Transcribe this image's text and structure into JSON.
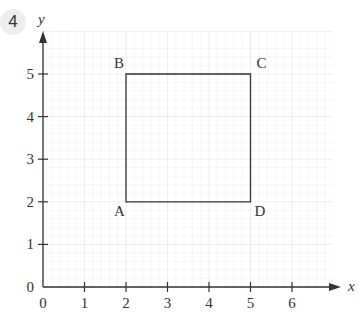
{
  "question_number": "4",
  "axes": {
    "x_label": "x",
    "y_label": "y",
    "x_ticks": [
      "0",
      "1",
      "2",
      "3",
      "4",
      "5",
      "6"
    ],
    "y_ticks": [
      "0",
      "1",
      "2",
      "3",
      "4",
      "5"
    ]
  },
  "points": [
    {
      "name": "A",
      "x": 2,
      "y": 2
    },
    {
      "name": "B",
      "x": 2,
      "y": 5
    },
    {
      "name": "C",
      "x": 5,
      "y": 5
    },
    {
      "name": "D",
      "x": 5,
      "y": 2
    }
  ],
  "chart_data": {
    "type": "scatter",
    "title": "",
    "xlabel": "x",
    "ylabel": "y",
    "xlim": [
      0,
      7
    ],
    "ylim": [
      0,
      6
    ],
    "grid": true,
    "shape": "square ABCD",
    "points": [
      {
        "label": "A",
        "x": 2,
        "y": 2
      },
      {
        "label": "B",
        "x": 2,
        "y": 5
      },
      {
        "label": "C",
        "x": 5,
        "y": 5
      },
      {
        "label": "D",
        "x": 5,
        "y": 2
      }
    ]
  },
  "colors": {
    "axis": "#333333",
    "grid": "#ececec",
    "shape": "#333333"
  }
}
